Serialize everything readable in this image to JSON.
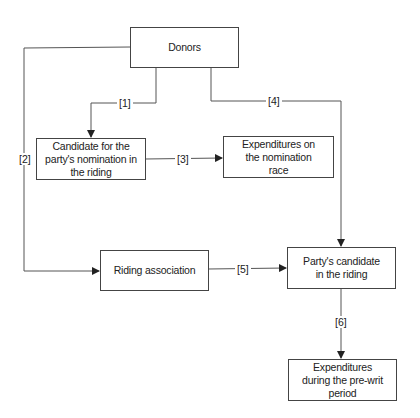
{
  "nodes": {
    "donors": {
      "label": "Donors"
    },
    "candidate_nomination": {
      "label": "Candidate for the party's nomination in the riding"
    },
    "expenditures_nomination": {
      "label": "Expenditures on the nomination race"
    },
    "riding_association": {
      "label": "Riding association"
    },
    "party_candidate": {
      "label": "Party's candidate in the riding"
    },
    "expenditures_prewrit": {
      "label": "Expenditures during the pre-writ period"
    }
  },
  "edges": {
    "e1": {
      "label": "[1]",
      "from": "Donors",
      "to": "Candidate for the party's nomination in the riding"
    },
    "e2": {
      "label": "[2]",
      "from": "Donors",
      "to": "Riding association"
    },
    "e3": {
      "label": "[3]",
      "from": "Candidate for the party's nomination in the riding",
      "to": "Expenditures on the nomination race"
    },
    "e4": {
      "label": "[4]",
      "from": "Donors",
      "to": "Party's candidate in the riding"
    },
    "e5": {
      "label": "[5]",
      "from": "Riding association",
      "to": "Party's candidate in the riding"
    },
    "e6": {
      "label": "[6]",
      "from": "Party's candidate in the riding",
      "to": "Expenditures during the pre-writ period"
    }
  },
  "colors": {
    "line": "#444444",
    "background": "#ffffff"
  }
}
